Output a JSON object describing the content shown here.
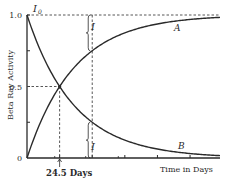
{
  "chart_data": {
    "type": "line",
    "title": "",
    "xlabel": "Time in Days",
    "ylabel": "Beta Ray Activity",
    "xlim": [
      0,
      145
    ],
    "ylim": [
      0,
      1.0
    ],
    "yticks": [
      "0",
      "0.5",
      "1.0"
    ],
    "half_life_days": 24.5,
    "annotations": {
      "initial_activity": "I",
      "initial_activity_sub": "0",
      "half_life_label": "24.5 Days",
      "gap_label_top": "I",
      "gap_label_bottom": "I",
      "marker_time_days": 49
    },
    "series": [
      {
        "name": "A",
        "kind": "growth",
        "formula": "1 - exp(-ln2 * t / 24.5)",
        "points": [
          [
            0,
            0
          ],
          [
            12,
            0.29
          ],
          [
            24.5,
            0.5
          ],
          [
            49,
            0.75
          ],
          [
            73.5,
            0.875
          ],
          [
            98,
            0.94
          ],
          [
            145,
            0.98
          ]
        ]
      },
      {
        "name": "B",
        "kind": "decay",
        "formula": "exp(-ln2 * t / 24.5)",
        "points": [
          [
            0,
            1
          ],
          [
            12,
            0.71
          ],
          [
            24.5,
            0.5
          ],
          [
            49,
            0.25
          ],
          [
            73.5,
            0.125
          ],
          [
            98,
            0.06
          ],
          [
            145,
            0.02
          ]
        ]
      }
    ],
    "grid": false,
    "legend": "inline-labels"
  }
}
